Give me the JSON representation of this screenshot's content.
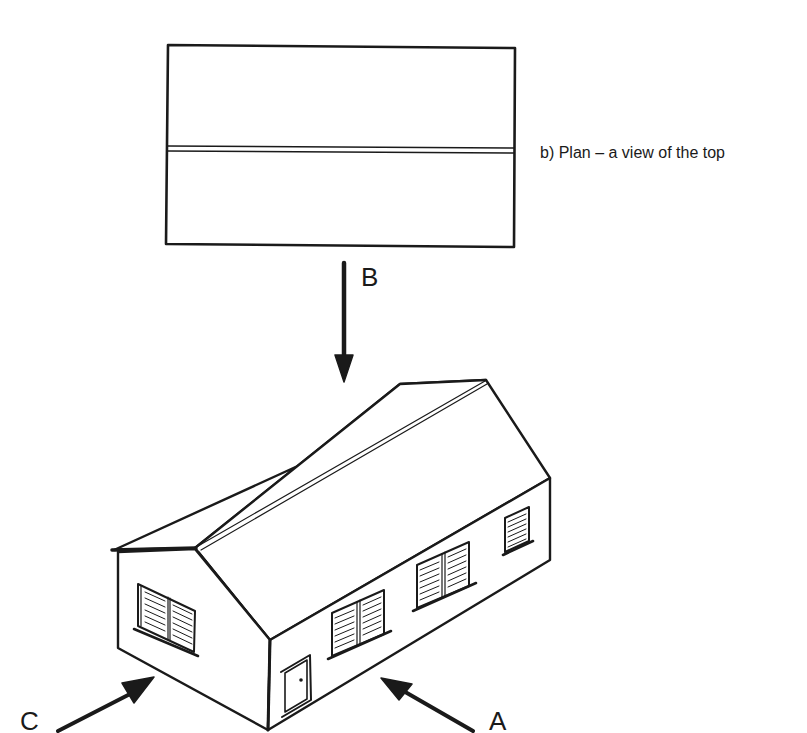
{
  "figure": {
    "plan_caption": "b) Plan – a view of the top",
    "view_labels": {
      "top_view": "B",
      "end_view": "C",
      "front_view": "A"
    },
    "colors": {
      "ink": "#1a1a1a",
      "background": "#ffffff"
    },
    "icons": [
      "arrow-b-icon",
      "arrow-c-icon",
      "arrow-a-icon",
      "house-icon",
      "plan-view-icon"
    ]
  }
}
